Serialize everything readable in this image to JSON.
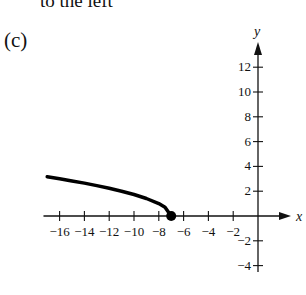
{
  "header": {
    "fragment_text": "to the left",
    "part_label": "(c)"
  },
  "chart_data": {
    "type": "line",
    "title": "",
    "xlabel": "x",
    "ylabel": "y",
    "x_ticks": [
      -16,
      -14,
      -12,
      -10,
      -8,
      -6,
      -4,
      -2
    ],
    "x_tick_labels": [
      "−16",
      "−14",
      "−12",
      "−10",
      "−8",
      "−6",
      "−4",
      "−2"
    ],
    "y_ticks": [
      12,
      10,
      8,
      6,
      4,
      2,
      -2,
      -4
    ],
    "y_tick_labels": [
      "12",
      "10",
      "8",
      "6",
      "4",
      "2",
      "−2",
      "−4"
    ],
    "xlim": [
      -17,
      2
    ],
    "ylim": [
      -4.5,
      14
    ],
    "grid": false,
    "series": [
      {
        "name": "y = sqrt(-x - 7)",
        "x": [
          -17,
          -16,
          -15,
          -14,
          -13,
          -12,
          -11,
          -10,
          -9,
          -8,
          -7.5,
          -7
        ],
        "y": [
          3.16,
          3.0,
          2.83,
          2.65,
          2.45,
          2.24,
          2.0,
          1.73,
          1.41,
          1.0,
          0.71,
          0
        ]
      }
    ],
    "endpoint": {
      "x": -7,
      "y": 0,
      "filled": true
    }
  }
}
